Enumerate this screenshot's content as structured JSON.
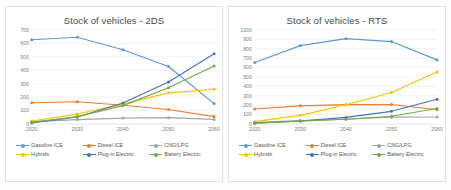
{
  "page": {
    "background_color": "#fdfdfd",
    "card_border_color": "#e2e2e2"
  },
  "series_colors": {
    "gasoline_ice": "#5B9BD5",
    "diesel_ice": "#ED7D31",
    "cng_lpg": "#A5A5A5",
    "hybrids": "#FFC000",
    "plugin_electric": "#4472C4",
    "battery_electric": "#70AD47"
  },
  "legend": {
    "items": [
      {
        "label": "Gasoline ICE",
        "color": "#5B9BD5"
      },
      {
        "label": "Diesel ICE",
        "color": "#ED7D31"
      },
      {
        "label": "CNG/LPG",
        "color": "#A5A5A5"
      },
      {
        "label": "Hybrids",
        "color": "#FFC000"
      },
      {
        "label": "Plug-in Electric",
        "color": "#4472C4"
      },
      {
        "label": "Battery Electric",
        "color": "#70AD47"
      }
    ]
  },
  "chart_data": [
    {
      "id": "chart-2ds",
      "type": "line",
      "title": "Stock of vehicles - 2DS",
      "xlabel": "",
      "ylabel": "",
      "x": [
        "2020",
        "2030",
        "2040",
        "2050",
        "2060"
      ],
      "categories": [
        "2020",
        "2030",
        "2040",
        "2050",
        "2060"
      ],
      "yticks": [
        0,
        100,
        200,
        300,
        400,
        500,
        600,
        700
      ],
      "ylim": [
        0,
        700
      ],
      "grid": true,
      "legend_position": "bottom",
      "series": [
        {
          "name": "Gasoline ICE",
          "color": "#5B9BD5",
          "values": [
            627,
            646,
            553,
            428,
            152
          ]
        },
        {
          "name": "Diesel ICE",
          "color": "#ED7D31",
          "values": [
            158,
            166,
            140,
            108,
            55
          ]
        },
        {
          "name": "CNG/LPG",
          "color": "#A5A5A5",
          "values": [
            18,
            33,
            44,
            47,
            34
          ]
        },
        {
          "name": "Hybrids",
          "color": "#FFC000",
          "values": [
            22,
            74,
            148,
            232,
            259
          ]
        },
        {
          "name": "Plug-in Electric",
          "color": "#4472C4",
          "values": [
            8,
            52,
            156,
            313,
            523
          ]
        },
        {
          "name": "Battery Electric",
          "color": "#70AD47",
          "values": [
            12,
            55,
            137,
            270,
            432
          ]
        }
      ]
    },
    {
      "id": "chart-rts",
      "type": "line",
      "title": "Stock of vehicles - RTS",
      "xlabel": "",
      "ylabel": "",
      "x": [
        "2020",
        "2030",
        "2040",
        "2050",
        "2060"
      ],
      "categories": [
        "2020",
        "2030",
        "2040",
        "2050",
        "2060"
      ],
      "yticks": [
        0,
        100,
        200,
        300,
        400,
        500,
        600,
        700,
        800,
        900,
        1000
      ],
      "ylim": [
        0,
        1000
      ],
      "grid": true,
      "legend_position": "bottom",
      "series": [
        {
          "name": "Gasoline ICE",
          "color": "#5B9BD5",
          "values": [
            654,
            834,
            908,
            877,
            682
          ]
        },
        {
          "name": "Diesel ICE",
          "color": "#ED7D31",
          "values": [
            160,
            193,
            206,
            207,
            152
          ]
        },
        {
          "name": "CNG/LPG",
          "color": "#A5A5A5",
          "values": [
            18,
            37,
            52,
            73,
            74
          ]
        },
        {
          "name": "Hybrids",
          "color": "#FFC000",
          "values": [
            25,
            92,
            205,
            335,
            553
          ]
        },
        {
          "name": "Plug-in Electric",
          "color": "#4472C4",
          "values": [
            8,
            32,
            70,
            135,
            263
          ]
        },
        {
          "name": "Battery Electric",
          "color": "#70AD47",
          "values": [
            10,
            30,
            50,
            83,
            165
          ]
        }
      ]
    }
  ]
}
